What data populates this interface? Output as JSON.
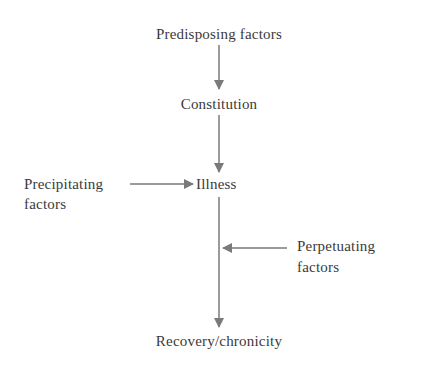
{
  "diagram": {
    "nodes": {
      "predisposing": "Predisposing factors",
      "constitution": "Constitution",
      "illness": "Illness",
      "precipitating_line1": "Precipitating",
      "precipitating_line2": "factors",
      "perpetuating_line1": "Perpetuating",
      "perpetuating_line2": "factors",
      "outcome": "Recovery/chronicity"
    },
    "edges": [
      {
        "from": "Predisposing factors",
        "to": "Constitution"
      },
      {
        "from": "Constitution",
        "to": "Illness"
      },
      {
        "from": "Precipitating factors",
        "to": "Illness"
      },
      {
        "from": "Perpetuating factors",
        "to": "Illness→Recovery/chronicity path"
      },
      {
        "from": "Illness",
        "to": "Recovery/chronicity"
      }
    ],
    "colors": {
      "text": "#3a3a3a",
      "arrow": "#7a7a7a"
    }
  }
}
